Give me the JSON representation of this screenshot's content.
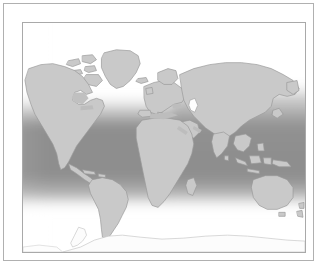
{
  "figure": {
    "kind": "world-map",
    "projection": "plate-carree",
    "title": "",
    "caption": "",
    "background_color": "#ffffff",
    "outer_frame_color": "#b0b0b0",
    "inner_frame_color": "#a9a9a9"
  },
  "map": {
    "land_fill": "#c9c9c9",
    "land_stroke": "#9a9a9a",
    "ocean_base": "#ffffff",
    "antarctica_fill": "#fbfbfb",
    "antarctica_stroke": "#c6c6c6",
    "overlay": {
      "name": "tropical-temperate-shading-band",
      "dark_color": "#8e8e8e",
      "mid_color": "#b4b4b4",
      "light_color": "#ffffff",
      "description": "Dark grey ocean shading band spanning low and mid latitudes, fading to white toward both poles, tilted higher on the eastern side"
    },
    "regions": [
      "North America",
      "Greenland",
      "Canadian Arctic Archipelago",
      "South America",
      "Africa",
      "Madagascar",
      "Europe",
      "Scandinavia",
      "Asia",
      "Siberia",
      "India",
      "Arabian Peninsula",
      "Southeast Asia",
      "Japan",
      "Indonesia",
      "Australia",
      "New Zealand",
      "Antarctica"
    ],
    "inland_waters": [
      "Caspian Sea",
      "Black Sea",
      "Mediterranean Sea",
      "Great Lakes",
      "Hudson Bay",
      "Red Sea",
      "Persian Gulf"
    ]
  }
}
